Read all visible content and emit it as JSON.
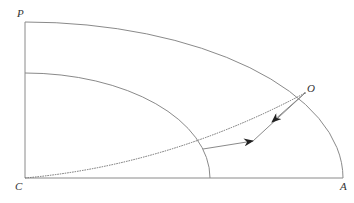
{
  "diagram": {
    "labels": {
      "P": "P",
      "O": "O",
      "C": "C",
      "A": "A"
    },
    "colors": {
      "stroke": "#8a8a8a",
      "dotted": "#6e6e6e",
      "arrow": "#222222",
      "text": "#333333",
      "background": "#ffffff"
    },
    "elements": [
      {
        "type": "axis-vertical",
        "from": "C",
        "to": "P"
      },
      {
        "type": "axis-horizontal",
        "from": "C",
        "to": "A"
      },
      {
        "type": "outer-arc",
        "from": "P",
        "to": "A",
        "through": "O"
      },
      {
        "type": "inner-arc"
      },
      {
        "type": "dotted-curve",
        "from": "C",
        "to": "O"
      },
      {
        "type": "arrow",
        "from": "O",
        "direction": "down-left"
      },
      {
        "type": "arrow",
        "direction": "toward-O",
        "start": "inner-arc-intersection"
      }
    ]
  }
}
